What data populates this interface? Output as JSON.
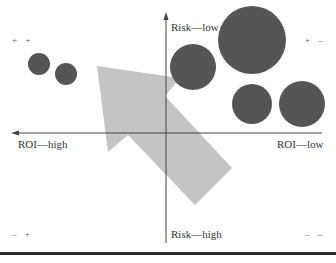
{
  "axes": {
    "vertical_top": "Risk—low",
    "vertical_bottom": "Risk—high",
    "horizontal_left": "ROI—high",
    "horizontal_right": "ROI—low"
  },
  "quadrants": {
    "top_left": "+ +",
    "top_right": "+ –",
    "bottom_left": "– +",
    "bottom_right": "– –"
  },
  "colors": {
    "circle": "#555555",
    "arrow": "#c4c4c4",
    "axis": "#444444"
  },
  "circles": [
    {
      "cx": 39,
      "cy": 64,
      "r": 11
    },
    {
      "cx": 66,
      "cy": 74,
      "r": 11
    },
    {
      "cx": 193,
      "cy": 67,
      "r": 23
    },
    {
      "cx": 252,
      "cy": 40,
      "r": 34
    },
    {
      "cx": 252,
      "cy": 104,
      "r": 20
    },
    {
      "cx": 302,
      "cy": 104,
      "r": 23
    }
  ],
  "arrow": {
    "points": "97,66 180,78 165,96 232,168 195,205 128,135 108,152"
  }
}
